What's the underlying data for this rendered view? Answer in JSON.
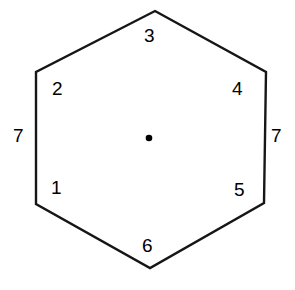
{
  "figure": {
    "type": "hexagon-diagram",
    "background_color": "#ffffff",
    "stroke_color": "#161616",
    "stroke_width": 2.4,
    "text_color": "#000000",
    "center_dot": {
      "label": "center-dot",
      "cx": 149,
      "cy": 138,
      "r": 3.3,
      "color": "#000000"
    },
    "vertices": [
      {
        "name": "top",
        "x": 155,
        "y": 11
      },
      {
        "name": "upper-right",
        "x": 266,
        "y": 72
      },
      {
        "name": "lower-right",
        "x": 264,
        "y": 203
      },
      {
        "name": "bottom",
        "x": 150,
        "y": 268
      },
      {
        "name": "lower-left",
        "x": 36,
        "y": 204
      },
      {
        "name": "upper-left",
        "x": 36,
        "y": 72
      }
    ],
    "polygon_points": "155,11 266,72 264,203 150,268 36,204 36,72",
    "labels": [
      {
        "id": "label-3",
        "text": "3",
        "position": "top"
      },
      {
        "id": "label-2",
        "text": "2",
        "position": "upper-left"
      },
      {
        "id": "label-4",
        "text": "4",
        "position": "upper-right"
      },
      {
        "id": "label-7-left",
        "text": "7",
        "position": "left-outer"
      },
      {
        "id": "label-7-right",
        "text": "7",
        "position": "right-outer"
      },
      {
        "id": "label-1",
        "text": "1",
        "position": "lower-left"
      },
      {
        "id": "label-5",
        "text": "5",
        "position": "lower-right"
      },
      {
        "id": "label-6",
        "text": "6",
        "position": "bottom"
      }
    ]
  }
}
